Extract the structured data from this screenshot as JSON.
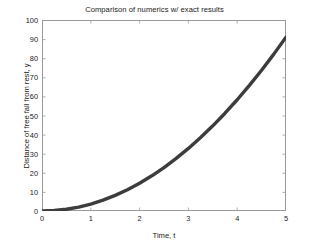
{
  "chart_data": {
    "type": "line",
    "title": "Comparison of numerics w/ exact results",
    "xlabel": "Time, t",
    "ylabel": "Distance of free fall from rest, y",
    "xlim": [
      0,
      5
    ],
    "ylim": [
      0,
      100
    ],
    "xticks": [
      0,
      1,
      2,
      3,
      4,
      5
    ],
    "yticks": [
      0,
      10,
      20,
      30,
      40,
      50,
      60,
      70,
      80,
      90,
      100
    ],
    "xtick_labels": [
      "0",
      "1",
      "2",
      "3",
      "4",
      "5"
    ],
    "ytick_labels": [
      "0",
      "10",
      "20",
      "30",
      "40",
      "50",
      "60",
      "70",
      "80",
      "90",
      "100"
    ],
    "grid": false,
    "legend": null,
    "legend_position": "none",
    "series": [
      {
        "name": "numerics / exact (overlapping)",
        "color": "#3c3c3c",
        "line_width": 3.4,
        "x": [
          0,
          0.25,
          0.5,
          0.75,
          1,
          1.25,
          1.5,
          1.75,
          2,
          2.25,
          2.5,
          2.75,
          3,
          3.25,
          3.5,
          3.75,
          4,
          4.25,
          4.5,
          4.75,
          5
        ],
        "y": [
          0,
          0.23,
          0.91,
          2.05,
          3.64,
          5.69,
          8.19,
          11.15,
          14.56,
          18.43,
          22.75,
          27.53,
          32.76,
          38.45,
          44.59,
          51.19,
          58.24,
          65.75,
          73.71,
          82.13,
          91.0
        ]
      }
    ]
  },
  "figure": {
    "background_color": "#ffffff",
    "axis_color": "#9a9a9a",
    "text_color": "#1a1a1a"
  }
}
